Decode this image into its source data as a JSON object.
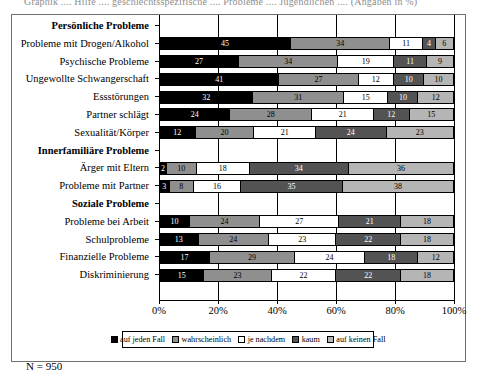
{
  "cut_title_text": "Graphik  ....  Hilfe  ....  geschlechtsspezifische  ....  Probleme  ....  Jugendlichen  ....  (Angaben in %)",
  "footnote": "N = 950",
  "legend": {
    "entries": [
      {
        "label": "auf jeden Fall",
        "color": "#000000"
      },
      {
        "label": "wahrscheinlich",
        "color": "#8f8f8f"
      },
      {
        "label": "je nachdem",
        "color": "#ffffff"
      },
      {
        "label": "kaum",
        "color": "#535353"
      },
      {
        "label": "auf keinen Fall",
        "color": "#b5b5b5"
      }
    ]
  },
  "chart_data": {
    "type": "bar",
    "orientation": "horizontal",
    "stacked": true,
    "normalized_percent": true,
    "title": "",
    "xlabel": "",
    "ylabel": "",
    "xlim": [
      0,
      100
    ],
    "xticks": [
      0,
      20,
      40,
      60,
      80,
      100
    ],
    "xticklabels": [
      "0%",
      "20%",
      "40%",
      "60%",
      "80%",
      "100%"
    ],
    "grid": true,
    "legend_position": "bottom",
    "series_names": [
      "auf jeden Fall",
      "wahrscheinlich",
      "je nachdem",
      "kaum",
      "auf keinen Fall"
    ],
    "series_colors": [
      "#000000",
      "#8f8f8f",
      "#ffffff",
      "#535353",
      "#b5b5b5"
    ],
    "rows": [
      {
        "label": "Persönliche Probleme",
        "group": true,
        "values": []
      },
      {
        "label": "Probleme mit Drogen/Alkohol",
        "group": false,
        "values": [
          45,
          34,
          11,
          4,
          6
        ]
      },
      {
        "label": "Psychische Probleme",
        "group": false,
        "values": [
          27,
          34,
          19,
          11,
          9
        ]
      },
      {
        "label": "Ungewollte Schwangerschaft",
        "group": false,
        "values": [
          41,
          27,
          12,
          10,
          10
        ]
      },
      {
        "label": "Essstörungen",
        "group": false,
        "values": [
          32,
          31,
          15,
          10,
          12
        ]
      },
      {
        "label": "Partner schlägt",
        "group": false,
        "values": [
          24,
          28,
          21,
          12,
          15
        ]
      },
      {
        "label": "Sexualität/Körper",
        "group": false,
        "values": [
          12,
          20,
          21,
          24,
          23
        ]
      },
      {
        "label": "Innerfamiliäre Probleme",
        "group": true,
        "values": []
      },
      {
        "label": "Ärger mit Eltern",
        "group": false,
        "values": [
          2,
          10,
          18,
          34,
          36
        ]
      },
      {
        "label": "Probleme mit Partner",
        "group": false,
        "values": [
          3,
          8,
          16,
          35,
          38
        ]
      },
      {
        "label": "Soziale Probleme",
        "group": true,
        "values": []
      },
      {
        "label": "Probleme bei Arbeit",
        "group": false,
        "values": [
          10,
          24,
          27,
          21,
          18
        ]
      },
      {
        "label": "Schulprobleme",
        "group": false,
        "values": [
          13,
          24,
          23,
          22,
          18
        ]
      },
      {
        "label": "Finanzielle Probleme",
        "group": false,
        "values": [
          17,
          29,
          24,
          18,
          12
        ]
      },
      {
        "label": "Diskriminierung",
        "group": false,
        "values": [
          15,
          23,
          22,
          22,
          18
        ]
      }
    ]
  }
}
